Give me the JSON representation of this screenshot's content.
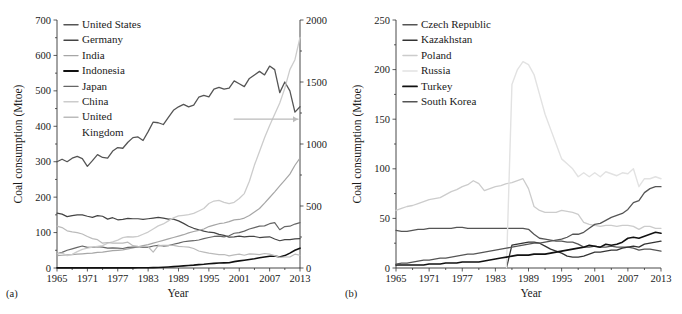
{
  "figure": {
    "panel_a_tag": "(a)",
    "panel_b_tag": "(b)"
  },
  "chart_data": [
    {
      "type": "line",
      "panel": "(a)",
      "title": "",
      "xlabel": "Year",
      "ylabel": "Coal consumption (Mtoe)",
      "ylabel_right": "",
      "xlim": [
        1965,
        2013
      ],
      "ylim": [
        0,
        700
      ],
      "ylim_right": [
        0,
        2000
      ],
      "xticks": [
        1965,
        1971,
        1977,
        1983,
        1989,
        1995,
        2001,
        2007,
        2013
      ],
      "yticks": [
        0,
        100,
        200,
        300,
        400,
        500,
        600,
        700
      ],
      "yticks_right": [
        0,
        500,
        1000,
        1500,
        2000
      ],
      "grid": false,
      "legend_position": "upper-left",
      "annotation": "arrow pointing to right axis (China series)",
      "x": [
        1965,
        1966,
        1967,
        1968,
        1969,
        1970,
        1971,
        1972,
        1973,
        1974,
        1975,
        1976,
        1977,
        1978,
        1979,
        1980,
        1981,
        1982,
        1983,
        1984,
        1985,
        1986,
        1987,
        1988,
        1989,
        1990,
        1991,
        1992,
        1993,
        1994,
        1995,
        1996,
        1997,
        1998,
        1999,
        2000,
        2001,
        2002,
        2003,
        2004,
        2005,
        2006,
        2007,
        2008,
        2009,
        2010,
        2011,
        2012,
        2013
      ],
      "series": [
        {
          "name": "United States",
          "color": "#555555",
          "axis": "left",
          "width": 1.3,
          "values": [
            300,
            307,
            300,
            310,
            315,
            309,
            287,
            303,
            320,
            312,
            310,
            330,
            340,
            338,
            355,
            368,
            370,
            360,
            385,
            412,
            410,
            405,
            425,
            445,
            455,
            462,
            455,
            460,
            482,
            487,
            483,
            505,
            510,
            505,
            508,
            528,
            520,
            512,
            535,
            545,
            555,
            545,
            570,
            560,
            495,
            525,
            500,
            440,
            455
          ]
        },
        {
          "name": "Germany",
          "color": "#444444",
          "axis": "left",
          "width": 1.2,
          "values": [
            155,
            152,
            145,
            148,
            150,
            150,
            146,
            143,
            148,
            146,
            138,
            142,
            136,
            137,
            140,
            139,
            139,
            137,
            139,
            141,
            143,
            141,
            138,
            138,
            133,
            126,
            118,
            112,
            108,
            104,
            101,
            100,
            95,
            92,
            87,
            88,
            90,
            88,
            89,
            89,
            86,
            87,
            88,
            82,
            77,
            80,
            80,
            82,
            83
          ]
        },
        {
          "name": "India",
          "color": "#a6a6a6",
          "axis": "left",
          "width": 1.2,
          "values": [
            35,
            36,
            37,
            38,
            39,
            40,
            41,
            42,
            44,
            45,
            47,
            49,
            50,
            51,
            54,
            57,
            60,
            63,
            66,
            70,
            74,
            78,
            82,
            86,
            90,
            94,
            99,
            103,
            106,
            110,
            117,
            121,
            125,
            127,
            131,
            136,
            137,
            141,
            148,
            158,
            168,
            183,
            199,
            215,
            232,
            248,
            265,
            290,
            310
          ]
        },
        {
          "name": "Indonesia",
          "color": "#111111",
          "axis": "left",
          "width": 1.6,
          "values": [
            0.3,
            0.3,
            0.3,
            0.3,
            0.3,
            0.3,
            0.3,
            0.3,
            0.3,
            0.3,
            0.3,
            0.4,
            0.4,
            0.4,
            0.4,
            0.4,
            0.5,
            0.6,
            0.8,
            1.0,
            1.5,
            2.2,
            3.0,
            4.0,
            5.0,
            6.0,
            7.0,
            8.0,
            9.5,
            10.5,
            12,
            13,
            14,
            14.5,
            15,
            18,
            20,
            22,
            24,
            26,
            29,
            31,
            33,
            34,
            31,
            35,
            42,
            50,
            56
          ]
        },
        {
          "name": "Japan",
          "color": "#666666",
          "axis": "left",
          "width": 1.2,
          "values": [
            40,
            44,
            50,
            54,
            58,
            62,
            58,
            58,
            60,
            59,
            56,
            57,
            56,
            55,
            58,
            59,
            60,
            58,
            58,
            62,
            64,
            62,
            63,
            67,
            70,
            74,
            76,
            77,
            79,
            83,
            86,
            89,
            90,
            88,
            91,
            98,
            100,
            104,
            110,
            114,
            118,
            119,
            125,
            128,
            108,
            117,
            118,
            124,
            128
          ]
        },
        {
          "name": "China",
          "color": "#cccccc",
          "axis": "right",
          "width": 1.3,
          "values": [
            114,
            120,
            100,
            110,
            132,
            150,
            160,
            168,
            175,
            180,
            200,
            210,
            225,
            245,
            252,
            250,
            255,
            272,
            290,
            315,
            340,
            355,
            380,
            405,
            420,
            425,
            430,
            440,
            460,
            480,
            520,
            540,
            545,
            530,
            520,
            530,
            560,
            600,
            700,
            830,
            940,
            1050,
            1150,
            1240,
            1330,
            1450,
            1600,
            1680,
            1860
          ]
        },
        {
          "name": "United Kingdom",
          "color": "#bbbbbb",
          "axis": "left",
          "width": 1.2,
          "values": [
            118,
            114,
            105,
            102,
            100,
            96,
            89,
            83,
            80,
            70,
            72,
            70,
            70,
            70,
            73,
            63,
            61,
            60,
            60,
            45,
            63,
            64,
            64,
            64,
            61,
            60,
            59,
            55,
            48,
            45,
            42,
            40,
            38,
            38,
            34,
            37,
            39,
            36,
            40,
            39,
            38,
            41,
            39,
            35,
            30,
            31,
            31,
            39,
            36
          ]
        }
      ]
    },
    {
      "type": "line",
      "panel": "(b)",
      "title": "",
      "xlabel": "Year",
      "ylabel": "Coal consumption (Mtoe)",
      "xlim": [
        1965,
        2013
      ],
      "ylim": [
        0,
        250
      ],
      "xticks": [
        1965,
        1971,
        1977,
        1983,
        1989,
        1995,
        2001,
        2007,
        2013
      ],
      "yticks": [
        0,
        50,
        100,
        150,
        200,
        250
      ],
      "grid": false,
      "legend_position": "upper-left",
      "x": [
        1965,
        1966,
        1967,
        1968,
        1969,
        1970,
        1971,
        1972,
        1973,
        1974,
        1975,
        1976,
        1977,
        1978,
        1979,
        1980,
        1981,
        1982,
        1983,
        1984,
        1985,
        1986,
        1987,
        1988,
        1989,
        1990,
        1991,
        1992,
        1993,
        1994,
        1995,
        1996,
        1997,
        1998,
        1999,
        2000,
        2001,
        2002,
        2003,
        2004,
        2005,
        2006,
        2007,
        2008,
        2009,
        2010,
        2011,
        2012,
        2013
      ],
      "series": [
        {
          "name": "Czech Republic",
          "color": "#555555",
          "axis": "left",
          "width": 1.3,
          "values": [
            38,
            37,
            37,
            38,
            39,
            39,
            40,
            40,
            40,
            40,
            40,
            41,
            41,
            40,
            40,
            40,
            40,
            40,
            40,
            40,
            40,
            40,
            40,
            40,
            39,
            34,
            30,
            29,
            28,
            27,
            27,
            26,
            26,
            24,
            21,
            21,
            22,
            21,
            21,
            22,
            21,
            21,
            21,
            20,
            18,
            19,
            19,
            18,
            17
          ]
        },
        {
          "name": "Kazakhstan",
          "color": "#333333",
          "axis": "left",
          "width": 1.3,
          "values": [
            null,
            null,
            null,
            null,
            null,
            null,
            null,
            null,
            null,
            null,
            null,
            null,
            null,
            null,
            null,
            null,
            null,
            null,
            null,
            null,
            0,
            23,
            24,
            25,
            26,
            26,
            25,
            22,
            19,
            17,
            15,
            12,
            11,
            11,
            12,
            14,
            16,
            16,
            17,
            18,
            18,
            20,
            21,
            22,
            21,
            24,
            25,
            26,
            27
          ]
        },
        {
          "name": "Poland",
          "color": "#cccccc",
          "axis": "left",
          "width": 1.3,
          "values": [
            58,
            60,
            62,
            63,
            65,
            67,
            69,
            70,
            71,
            74,
            77,
            79,
            82,
            84,
            88,
            85,
            78,
            80,
            82,
            83,
            85,
            86,
            88,
            90,
            80,
            62,
            58,
            56,
            56,
            56,
            58,
            57,
            56,
            54,
            46,
            44,
            43,
            42,
            43,
            43,
            42,
            43,
            43,
            42,
            39,
            42,
            42,
            40,
            40
          ]
        },
        {
          "name": "Russia",
          "color": "#e2e2e2",
          "axis": "left",
          "width": 1.4,
          "values": [
            null,
            null,
            null,
            null,
            null,
            null,
            null,
            null,
            null,
            null,
            null,
            null,
            null,
            null,
            null,
            null,
            null,
            null,
            null,
            null,
            0,
            185,
            200,
            208,
            205,
            195,
            175,
            155,
            140,
            125,
            110,
            105,
            100,
            92,
            96,
            92,
            96,
            92,
            97,
            95,
            93,
            96,
            95,
            100,
            82,
            90,
            90,
            92,
            90
          ]
        },
        {
          "name": "Turkey",
          "color": "#111111",
          "axis": "left",
          "width": 1.6,
          "values": [
            3,
            3,
            3,
            3,
            3,
            3,
            4,
            4,
            4,
            5,
            5,
            5,
            6,
            6,
            6,
            6,
            7,
            8,
            9,
            10,
            11,
            12,
            13,
            13,
            13,
            14,
            14,
            14,
            15,
            16,
            17,
            18,
            19,
            20,
            21,
            23,
            22,
            21,
            24,
            23,
            24,
            26,
            30,
            31,
            30,
            32,
            34,
            36,
            35
          ]
        },
        {
          "name": "South Korea",
          "color": "#555555",
          "axis": "left",
          "width": 1.3,
          "values": [
            4,
            5,
            5,
            6,
            7,
            8,
            8,
            9,
            10,
            10,
            11,
            12,
            13,
            14,
            14,
            15,
            16,
            17,
            18,
            19,
            20,
            21,
            22,
            23,
            24,
            25,
            25,
            26,
            27,
            28,
            29,
            31,
            34,
            34,
            36,
            40,
            44,
            45,
            48,
            51,
            53,
            55,
            59,
            66,
            68,
            76,
            80,
            82,
            82
          ]
        }
      ]
    }
  ]
}
